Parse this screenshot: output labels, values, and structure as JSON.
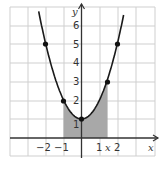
{
  "chart_data": {
    "type": "line",
    "title": "",
    "function": "y = x^2 + 1",
    "xlabel": "x",
    "ylabel": "y",
    "x_tick_labels": [
      "−2",
      "−1",
      "1",
      "x",
      "2"
    ],
    "y_tick_labels": [
      "1",
      "2",
      "3",
      "4",
      "5",
      "6"
    ],
    "xlim": [
      -4,
      4
    ],
    "ylim": [
      -1,
      7
    ],
    "grid": true,
    "points": [
      {
        "x": -2,
        "y": 5
      },
      {
        "x": -1,
        "y": 2
      },
      {
        "x": 0,
        "y": 1
      },
      {
        "x": 1.41,
        "y": 3
      },
      {
        "x": 2,
        "y": 5
      }
    ],
    "shaded_region": {
      "from_x": -1,
      "to_x": 1.45,
      "under": "curve",
      "color": "#aaaaaa"
    }
  },
  "labels": {
    "y_axis": "y",
    "x_axis": "x",
    "xticks": {
      "m2": "−2",
      "m1": "−1",
      "p1": "1",
      "px": "x",
      "p2": "2"
    },
    "yticks": {
      "t1": "1",
      "t2": "2",
      "t3": "3",
      "t4": "4",
      "t5": "5",
      "t6": "6"
    }
  },
  "colors": {
    "curve": "#1a1a1a",
    "shade": "#aaaaaa",
    "grid": "#cfcfcf",
    "axis": "#333333"
  }
}
